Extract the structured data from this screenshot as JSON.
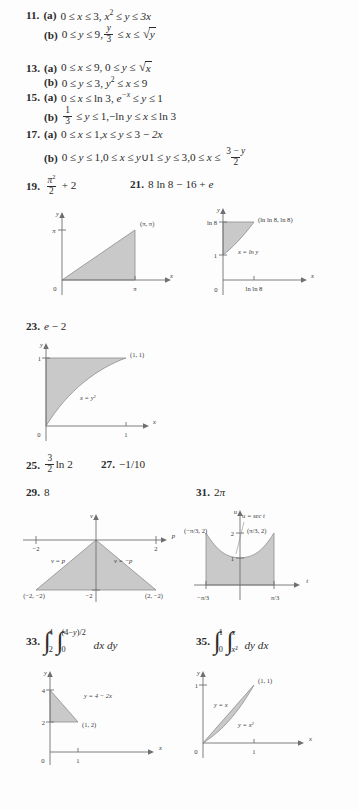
{
  "answers": [
    {
      "id": "11",
      "number": "11.",
      "parts": [
        {
          "label": "(a)",
          "text": "0 ≤ x ≤ 3, x² ≤ y ≤ 3x"
        },
        {
          "label": "(b)",
          "text": "0 ≤ y ≤ 9, y/3 ≤ x ≤ √y"
        }
      ]
    },
    {
      "id": "13",
      "number": "13.",
      "parts": [
        {
          "label": "(a)",
          "text": "0 ≤ x ≤ 9, 0 ≤ y ≤ √x"
        },
        {
          "label": "(b)",
          "text": "0 ≤ y ≤ 3, y² ≤ x ≤ 9"
        }
      ]
    },
    {
      "id": "15",
      "number": "15.",
      "parts": [
        {
          "label": "(a)",
          "text": "0 ≤ x ≤ ln 3, e⁻ˣ ≤ y ≤ 1"
        },
        {
          "label": "(b)",
          "text": "1/3 ≤ y ≤ 1, −ln y ≤ x ≤ ln 3"
        }
      ]
    },
    {
      "id": "17",
      "number": "17.",
      "parts": [
        {
          "label": "(a)",
          "text": "0 ≤ x ≤ 1, x ≤ y ≤ 3 − 2x"
        },
        {
          "label": "(b)",
          "text": "0 ≤ y ≤ 1, 0 ≤ x ≤ y ∪ 1 ≤ y ≤ 3, 0 ≤ x ≤ (3 − y)/2"
        }
      ]
    },
    {
      "id": "19",
      "number": "19.",
      "text": "π²/2 + 2"
    },
    {
      "id": "21",
      "number": "21.",
      "text": "8 ln 8 − 16 + e"
    },
    {
      "id": "23",
      "number": "23.",
      "text": "e − 2"
    },
    {
      "id": "25",
      "number": "25.",
      "text": "(3/2) ln 2"
    },
    {
      "id": "27",
      "number": "27.",
      "text": "−1/10"
    },
    {
      "id": "29",
      "number": "29.",
      "text": "8"
    },
    {
      "id": "31",
      "number": "31.",
      "text": "2π"
    },
    {
      "id": "33",
      "number": "33.",
      "text": "∫₂⁴ ∫₀^{(4−y)/2} dx dy"
    },
    {
      "id": "35",
      "number": "35.",
      "text": "∫₀¹ ∫_{x²}^{x} dy dx"
    }
  ],
  "tokens": {
    "zero": "0",
    "one": "1",
    "two": "2",
    "three": "3",
    "four": "4",
    "nine": "9",
    "sixteen": "16",
    "eight": "8",
    "le": "≤",
    "minus": "−",
    "plus": "+",
    "cup": "∪",
    "comma": ",",
    "x": "x",
    "y": "y",
    "e": "e",
    "ln": "ln",
    "ln3": "ln 3",
    "ln8": "ln 8",
    "lnlN8": "ln ln 8",
    "pi": "π",
    "dxdy": "dx dy",
    "dydx": "dy dx",
    "part_a": "(a)",
    "part_b": "(b)",
    "three_x": "3x",
    "two_x": "2x",
    "eight_ln8": "8 ln 8",
    "neg_one_ten": "−1/10",
    "frac_num_3": "3",
    "frac_den_2": "2",
    "frac_num_1": "1",
    "frac_den_3": "3",
    "int_up_4": "4",
    "int_lo_2": "2",
    "int_up_inner": "(4−y)/2",
    "int_lo_inner": "0",
    "int_up_1": "1",
    "int_lo_0": "0",
    "int_up_x": "x",
    "int_lo_x2": "x²",
    "neg_ln_y": "−ln y"
  },
  "figures": [
    {
      "id": "fig19",
      "caption_for": "19",
      "xlabel": "x",
      "ylabel": "y",
      "origin_label": "0",
      "x_ticks": [
        "π"
      ],
      "y_ticks": [
        "π"
      ],
      "point_labels": [
        "(π, π)"
      ],
      "curve_labels": [],
      "region": "triangle with vertices (0,0), (π,0), (π,π)"
    },
    {
      "id": "fig21",
      "caption_for": "21",
      "xlabel": "x",
      "ylabel": "y",
      "origin_label": "0",
      "x_ticks": [
        "ln ln 8"
      ],
      "y_ticks": [
        "1",
        "ln 8"
      ],
      "point_labels": [
        "(ln ln 8, ln 8)"
      ],
      "curve_labels": [
        "x = ln y"
      ],
      "region": "region between x = ln y and y-axis from y=1 to y=ln 8"
    },
    {
      "id": "fig23",
      "caption_for": "23",
      "xlabel": "x",
      "ylabel": "y",
      "origin_label": "0",
      "x_ticks": [
        "1"
      ],
      "y_ticks": [
        "1"
      ],
      "point_labels": [
        "(1, 1)"
      ],
      "curve_labels": [
        "x = y²"
      ],
      "region": "region left of x = y² from y=0 to y=1"
    },
    {
      "id": "fig29",
      "caption_for": "29",
      "xlabel": "p",
      "ylabel": "v",
      "origin_label": "",
      "x_ticks": [
        "−2",
        "2"
      ],
      "y_ticks": [
        "−2"
      ],
      "point_labels": [
        "(−2, −2)",
        "(2, −2)"
      ],
      "curve_labels": [
        "v = p",
        "v = −p"
      ],
      "region": "triangle with vertices (0,0), (−2,−2), (2,−2)"
    },
    {
      "id": "fig31",
      "caption_for": "31",
      "xlabel": "t",
      "ylabel": "u",
      "origin_label": "",
      "x_ticks": [
        "−π/3",
        "π/3"
      ],
      "y_ticks": [
        "1",
        "2"
      ],
      "point_labels": [
        "(−π/3, 2)",
        "(π/3, 2)"
      ],
      "curve_labels": [
        "u = sec t"
      ],
      "region": "region under u = sec t from t = −π/3 to π/3"
    },
    {
      "id": "fig33",
      "caption_for": "33",
      "xlabel": "x",
      "ylabel": "y",
      "origin_label": "0",
      "x_ticks": [
        "1"
      ],
      "y_ticks": [
        "2",
        "4"
      ],
      "point_labels": [
        "(1, 2)"
      ],
      "curve_labels": [
        "y = 4 − 2x"
      ],
      "region": "triangle with vertices (0,2), (0,4), (1,2)"
    },
    {
      "id": "fig35",
      "caption_for": "35",
      "xlabel": "x",
      "ylabel": "y",
      "origin_label": "0",
      "x_ticks": [
        "1"
      ],
      "y_ticks": [
        "1"
      ],
      "point_labels": [
        "(1, 1)"
      ],
      "curve_labels": [
        "y = x",
        "y = x²"
      ],
      "region": "region between y = x and y = x² from x=0 to x=1"
    }
  ]
}
